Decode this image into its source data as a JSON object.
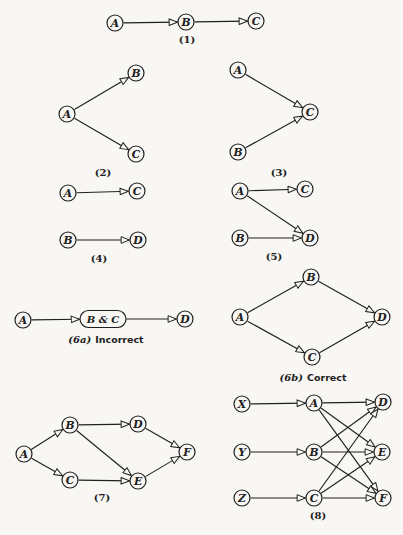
{
  "colors": {
    "paper": "#f8f7f4",
    "ink": "#202020"
  },
  "figure": {
    "width": 403,
    "height": 535,
    "node_radius": 8,
    "diagrams": [
      {
        "id": "1",
        "caption": {
          "label": "(1)",
          "x": 187,
          "y": 43
        },
        "nodes": [
          {
            "id": "A",
            "label": "A",
            "x": 115,
            "y": 23
          },
          {
            "id": "B",
            "label": "B",
            "x": 186,
            "y": 22
          },
          {
            "id": "C",
            "label": "C",
            "x": 256,
            "y": 21
          }
        ],
        "edges": [
          [
            "A",
            "B"
          ],
          [
            "B",
            "C"
          ]
        ]
      },
      {
        "id": "2",
        "caption": {
          "label": "(2)",
          "x": 103,
          "y": 176
        },
        "nodes": [
          {
            "id": "A",
            "label": "A",
            "x": 67,
            "y": 114
          },
          {
            "id": "B",
            "label": "B",
            "x": 136,
            "y": 73
          },
          {
            "id": "C",
            "label": "C",
            "x": 136,
            "y": 154
          }
        ],
        "edges": [
          [
            "A",
            "B"
          ],
          [
            "A",
            "C"
          ]
        ]
      },
      {
        "id": "3",
        "caption": {
          "label": "(3)",
          "x": 279,
          "y": 176
        },
        "nodes": [
          {
            "id": "A",
            "label": "A",
            "x": 238,
            "y": 70
          },
          {
            "id": "B",
            "label": "B",
            "x": 238,
            "y": 152
          },
          {
            "id": "C",
            "label": "C",
            "x": 310,
            "y": 112
          }
        ],
        "edges": [
          [
            "A",
            "C"
          ],
          [
            "B",
            "C"
          ]
        ]
      },
      {
        "id": "4",
        "caption": {
          "label": "(4)",
          "x": 99,
          "y": 262
        },
        "nodes": [
          {
            "id": "A",
            "label": "A",
            "x": 68,
            "y": 193
          },
          {
            "id": "C",
            "label": "C",
            "x": 137,
            "y": 191
          },
          {
            "id": "B",
            "label": "B",
            "x": 68,
            "y": 240
          },
          {
            "id": "D",
            "label": "D",
            "x": 138,
            "y": 240
          }
        ],
        "edges": [
          [
            "A",
            "C"
          ],
          [
            "B",
            "D"
          ]
        ]
      },
      {
        "id": "5",
        "caption": {
          "label": "(5)",
          "x": 274,
          "y": 260
        },
        "nodes": [
          {
            "id": "A",
            "label": "A",
            "x": 240,
            "y": 191
          },
          {
            "id": "C",
            "label": "C",
            "x": 305,
            "y": 189
          },
          {
            "id": "B",
            "label": "B",
            "x": 240,
            "y": 238
          },
          {
            "id": "D",
            "label": "D",
            "x": 310,
            "y": 238
          }
        ],
        "edges": [
          [
            "A",
            "C"
          ],
          [
            "A",
            "D"
          ],
          [
            "B",
            "D"
          ]
        ]
      },
      {
        "id": "6a",
        "caption": {
          "label": "(6a)",
          "suffix": "Incorrect",
          "italic": true,
          "x": 106,
          "y": 343
        },
        "nodes": [
          {
            "id": "A",
            "label": "A",
            "x": 23,
            "y": 320
          },
          {
            "id": "BC",
            "label": "B & C",
            "x": 103,
            "y": 319,
            "shape": "stadium",
            "w": 46,
            "h": 17
          },
          {
            "id": "D",
            "label": "D",
            "x": 185,
            "y": 319
          }
        ],
        "edges": [
          [
            "A",
            "BC"
          ],
          [
            "BC",
            "D"
          ]
        ]
      },
      {
        "id": "6b",
        "caption": {
          "label": "(6b)",
          "suffix": "Correct",
          "italic": true,
          "x": 313,
          "y": 381
        },
        "nodes": [
          {
            "id": "A",
            "label": "A",
            "x": 240,
            "y": 317
          },
          {
            "id": "B",
            "label": "B",
            "x": 311,
            "y": 277
          },
          {
            "id": "C",
            "label": "C",
            "x": 312,
            "y": 357
          },
          {
            "id": "D",
            "label": "D",
            "x": 382,
            "y": 317
          }
        ],
        "edges": [
          [
            "A",
            "B"
          ],
          [
            "A",
            "C"
          ],
          [
            "B",
            "D"
          ],
          [
            "C",
            "D"
          ]
        ]
      },
      {
        "id": "7",
        "caption": {
          "label": "(7)",
          "x": 102,
          "y": 501
        },
        "nodes": [
          {
            "id": "A",
            "label": "A",
            "x": 24,
            "y": 454
          },
          {
            "id": "B",
            "label": "B",
            "x": 70,
            "y": 425
          },
          {
            "id": "C",
            "label": "C",
            "x": 70,
            "y": 480
          },
          {
            "id": "D",
            "label": "D",
            "x": 138,
            "y": 424
          },
          {
            "id": "E",
            "label": "E",
            "x": 138,
            "y": 481
          },
          {
            "id": "F",
            "label": "F",
            "x": 187,
            "y": 452
          }
        ],
        "edges": [
          [
            "A",
            "B"
          ],
          [
            "A",
            "C"
          ],
          [
            "B",
            "D"
          ],
          [
            "B",
            "E"
          ],
          [
            "C",
            "E"
          ],
          [
            "D",
            "F"
          ],
          [
            "E",
            "F"
          ]
        ]
      },
      {
        "id": "8",
        "caption": {
          "label": "(8)",
          "x": 318,
          "y": 519
        },
        "nodes": [
          {
            "id": "X",
            "label": "X",
            "x": 242,
            "y": 404
          },
          {
            "id": "Y",
            "label": "Y",
            "x": 242,
            "y": 452
          },
          {
            "id": "Z",
            "label": "Z",
            "x": 242,
            "y": 498
          },
          {
            "id": "A",
            "label": "A",
            "x": 314,
            "y": 403
          },
          {
            "id": "B",
            "label": "B",
            "x": 314,
            "y": 452
          },
          {
            "id": "C",
            "label": "C",
            "x": 314,
            "y": 498
          },
          {
            "id": "D",
            "label": "D",
            "x": 383,
            "y": 402
          },
          {
            "id": "E",
            "label": "E",
            "x": 382,
            "y": 452
          },
          {
            "id": "F",
            "label": "F",
            "x": 383,
            "y": 498
          }
        ],
        "edges": [
          [
            "X",
            "A"
          ],
          [
            "Y",
            "B"
          ],
          [
            "Z",
            "C"
          ],
          [
            "A",
            "D"
          ],
          [
            "A",
            "E"
          ],
          [
            "A",
            "F"
          ],
          [
            "B",
            "D"
          ],
          [
            "B",
            "E"
          ],
          [
            "B",
            "F"
          ],
          [
            "C",
            "D"
          ],
          [
            "C",
            "E"
          ],
          [
            "C",
            "F"
          ]
        ]
      }
    ]
  }
}
